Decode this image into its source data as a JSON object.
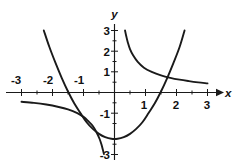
{
  "chart_data": {
    "type": "line",
    "title": "",
    "xlabel": "x",
    "ylabel": "y",
    "xlim": [
      -3,
      3
    ],
    "ylim": [
      -3,
      3
    ],
    "grid": false,
    "legend": null,
    "axis_style": "cartesian-cross",
    "xticks": [
      -3,
      -2,
      -1,
      1,
      2,
      3
    ],
    "yticks": [
      3,
      2,
      1,
      -1,
      -3
    ],
    "xtick_labels": [
      "-3",
      "-2",
      "-1",
      "1",
      "2",
      "3"
    ],
    "ytick_labels": [
      "3",
      "2",
      "1",
      "-1",
      "-3"
    ],
    "series": [
      {
        "name": "hyperbola",
        "equation": "y = 1/x",
        "style": "solid",
        "color": "#1a1a1a",
        "branches": [
          {
            "name": "left-branch",
            "x": [
              -3.0,
              -2.6,
              -2.2,
              -1.8,
              -1.5,
              -1.2,
              -1.0,
              -0.85,
              -0.7,
              -0.58,
              -0.48,
              -0.42,
              -0.37,
              -0.34
            ],
            "y": [
              -0.45,
              -0.5,
              -0.58,
              -0.7,
              -0.82,
              -1.0,
              -1.18,
              -1.38,
              -1.62,
              -1.92,
              -2.25,
              -2.52,
              -2.8,
              -2.98
            ]
          },
          {
            "name": "right-branch",
            "x": [
              0.34,
              0.38,
              0.43,
              0.5,
              0.6,
              0.75,
              0.95,
              1.2,
              1.5,
              1.8,
              2.1,
              2.4,
              2.7,
              3.0
            ],
            "y": [
              3.0,
              2.72,
              2.42,
              2.1,
              1.8,
              1.48,
              1.2,
              1.0,
              0.83,
              0.71,
              0.62,
              0.55,
              0.49,
              0.44
            ]
          }
        ]
      },
      {
        "name": "parabola",
        "equation": "y = x^2 - 2.2",
        "style": "solid",
        "color": "#1a1a1a",
        "vertex": [
          0,
          -2.25
        ],
        "x_intercepts": [
          -1.45,
          1.45
        ],
        "branches": [
          {
            "name": "parabola-curve",
            "x": [
              -2.28,
              -2.1,
              -1.9,
              -1.7,
              -1.5,
              -1.3,
              -1.1,
              -0.9,
              -0.7,
              -0.5,
              -0.3,
              -0.1,
              0.1,
              0.3,
              0.5,
              0.7,
              0.9,
              1.1,
              1.3,
              1.5,
              1.7,
              1.9,
              2.1,
              2.26
            ],
            "y": [
              3.0,
              2.2,
              1.42,
              0.7,
              0.05,
              -0.52,
              -0.99,
              -1.44,
              -1.76,
              -2.0,
              -2.16,
              -2.24,
              -2.24,
              -2.16,
              -2.0,
              -1.76,
              -1.44,
              -0.99,
              -0.52,
              0.05,
              0.7,
              1.42,
              2.2,
              3.0
            ]
          }
        ]
      }
    ],
    "annotations": [
      {
        "label": "intersection",
        "x": 1.6,
        "y": 0.78
      }
    ]
  }
}
